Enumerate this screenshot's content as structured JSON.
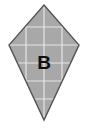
{
  "figure": {
    "type": "geometry-figure",
    "canvas": {
      "width": 88,
      "height": 128,
      "background_color": "#ffffff"
    },
    "shape": {
      "name": "kite",
      "label": "B",
      "fill_color": "#a8a8a8",
      "stroke_color": "#555555",
      "stroke_width": 1.4,
      "vertices": [
        {
          "name": "top-apex",
          "x": 44,
          "y": 5
        },
        {
          "name": "right-point",
          "x": 79,
          "y": 45
        },
        {
          "name": "bottom-apex",
          "x": 44,
          "y": 120
        },
        {
          "name": "left-point",
          "x": 9,
          "y": 45
        }
      ],
      "points_attr": "44,5 79,45 44,120 9,45"
    },
    "label": {
      "text": "B",
      "x": 44,
      "y": 64,
      "color": "#111111"
    },
    "grid": {
      "visible": true,
      "line_color": "#e6e6e6",
      "line_width": 1.2,
      "spacing": 18,
      "vertical_lines_x": [
        26,
        44,
        62
      ],
      "horizontal_lines_y": [
        27,
        45,
        63,
        81,
        99
      ]
    }
  }
}
